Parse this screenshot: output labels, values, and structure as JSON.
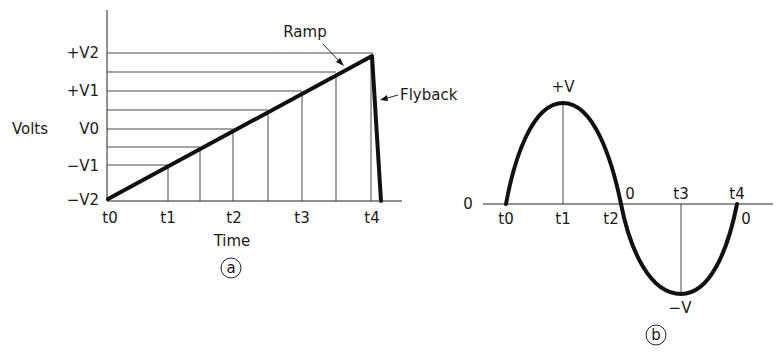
{
  "panel_a": {
    "y_axis_label": "Volts",
    "x_axis_label": "Time",
    "y_ticks": [
      "+V2",
      "+V1",
      "V0",
      "−V1",
      "−V2"
    ],
    "x_ticks": [
      "t0",
      "t1",
      "t2",
      "t3",
      "t4"
    ],
    "annotations": {
      "ramp": "Ramp",
      "flyback": "Flyback"
    },
    "panel_tag": "a"
  },
  "panel_b": {
    "zero_label_left": "0",
    "zero_label_t2": "0",
    "zero_label_t4": "0",
    "peak_label": "+V",
    "trough_label": "−V",
    "x_ticks": [
      "t0",
      "t1",
      "t2",
      "t3",
      "t4"
    ],
    "panel_tag": "b"
  },
  "colors": {
    "ink": "#111111",
    "background": "#ffffff"
  }
}
